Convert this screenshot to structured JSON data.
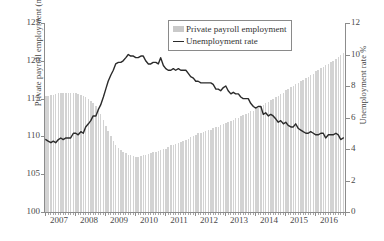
{
  "chart_data": {
    "type": "line",
    "title": "",
    "xlabel": "",
    "ylabel": "Private payroll employment (millions)",
    "ylabel_right": "Unemployment rate %",
    "ylim": [
      100,
      125
    ],
    "ylim_right": [
      0,
      12
    ],
    "xlim": [
      2007,
      2017
    ],
    "grid": false,
    "legend_position": "top-center",
    "yticks": [
      "125",
      "120",
      "115",
      "110",
      "105",
      "100"
    ],
    "yticks_right": [
      "12",
      "10",
      "8",
      "6",
      "4",
      "2",
      "0"
    ],
    "xticks": [
      "2007",
      "2008",
      "2009",
      "2010",
      "2011",
      "2012",
      "2013",
      "2014",
      "2015",
      "2016"
    ],
    "legend": [
      {
        "label": "Private payroll employment",
        "type": "bar",
        "color": "#d3d3d3"
      },
      {
        "label": "Unemployment rate",
        "type": "line",
        "color": "#2b2b2b"
      }
    ],
    "series": [
      {
        "name": "Private payroll employment",
        "type": "bar",
        "axis": "left",
        "unit": "millions",
        "x": [
          2007.0,
          2007.08,
          2007.17,
          2007.25,
          2007.33,
          2007.42,
          2007.5,
          2007.58,
          2007.67,
          2007.75,
          2007.83,
          2007.92,
          2008.0,
          2008.08,
          2008.17,
          2008.25,
          2008.33,
          2008.42,
          2008.5,
          2008.58,
          2008.67,
          2008.75,
          2008.83,
          2008.92,
          2009.0,
          2009.08,
          2009.17,
          2009.25,
          2009.33,
          2009.42,
          2009.5,
          2009.58,
          2009.67,
          2009.75,
          2009.83,
          2009.92,
          2010.0,
          2010.08,
          2010.17,
          2010.25,
          2010.33,
          2010.42,
          2010.5,
          2010.58,
          2010.67,
          2010.75,
          2010.83,
          2010.92,
          2011.0,
          2011.08,
          2011.17,
          2011.25,
          2011.33,
          2011.42,
          2011.5,
          2011.58,
          2011.67,
          2011.75,
          2011.83,
          2011.92,
          2012.0,
          2012.08,
          2012.17,
          2012.25,
          2012.33,
          2012.42,
          2012.5,
          2012.58,
          2012.67,
          2012.75,
          2012.83,
          2012.92,
          2013.0,
          2013.08,
          2013.17,
          2013.25,
          2013.33,
          2013.42,
          2013.5,
          2013.58,
          2013.67,
          2013.75,
          2013.83,
          2013.92,
          2014.0,
          2014.08,
          2014.17,
          2014.25,
          2014.33,
          2014.42,
          2014.5,
          2014.58,
          2014.67,
          2014.75,
          2014.83,
          2014.92,
          2015.0,
          2015.08,
          2015.17,
          2015.25,
          2015.33,
          2015.42,
          2015.5,
          2015.58,
          2015.67,
          2015.75,
          2015.83,
          2015.92,
          2016.0,
          2016.08,
          2016.17,
          2016.25,
          2016.33,
          2016.42,
          2016.5,
          2016.58,
          2016.67,
          2016.75,
          2016.83,
          2016.92
        ],
        "values": [
          115.3,
          115.4,
          115.5,
          115.5,
          115.6,
          115.7,
          115.7,
          115.7,
          115.8,
          115.8,
          115.8,
          115.8,
          115.7,
          115.6,
          115.5,
          115.3,
          115.2,
          115.0,
          114.7,
          114.4,
          114.0,
          113.5,
          112.9,
          112.2,
          111.4,
          110.7,
          110.0,
          109.4,
          108.9,
          108.5,
          108.2,
          108.0,
          107.8,
          107.6,
          107.5,
          107.4,
          107.3,
          107.3,
          107.4,
          107.5,
          107.6,
          107.7,
          107.8,
          107.9,
          108.0,
          108.1,
          108.2,
          108.3,
          108.4,
          108.6,
          108.8,
          108.9,
          109.0,
          109.1,
          109.2,
          109.4,
          109.5,
          109.7,
          109.9,
          110.0,
          110.2,
          110.4,
          110.5,
          110.6,
          110.7,
          110.8,
          110.9,
          111.1,
          111.2,
          111.3,
          111.5,
          111.6,
          111.8,
          111.9,
          112.1,
          112.2,
          112.4,
          112.5,
          112.7,
          112.8,
          113.0,
          113.1,
          113.3,
          113.4,
          113.6,
          113.8,
          114.0,
          114.2,
          114.4,
          114.6,
          114.8,
          115.0,
          115.2,
          115.4,
          115.6,
          115.8,
          116.1,
          116.3,
          116.5,
          116.7,
          116.9,
          117.1,
          117.3,
          117.5,
          117.7,
          117.9,
          118.1,
          118.3,
          118.6,
          118.8,
          119.0,
          119.2,
          119.4,
          119.6,
          119.8,
          120.0,
          120.3,
          120.5,
          120.8,
          121.0
        ]
      },
      {
        "name": "Unemployment rate",
        "type": "line",
        "axis": "right",
        "unit": "%",
        "x": [
          2007.0,
          2007.08,
          2007.17,
          2007.25,
          2007.33,
          2007.42,
          2007.5,
          2007.58,
          2007.67,
          2007.75,
          2007.83,
          2007.92,
          2008.0,
          2008.08,
          2008.17,
          2008.25,
          2008.33,
          2008.42,
          2008.5,
          2008.58,
          2008.67,
          2008.75,
          2008.83,
          2008.92,
          2009.0,
          2009.08,
          2009.17,
          2009.25,
          2009.33,
          2009.42,
          2009.5,
          2009.58,
          2009.67,
          2009.75,
          2009.83,
          2009.92,
          2010.0,
          2010.08,
          2010.17,
          2010.25,
          2010.33,
          2010.42,
          2010.5,
          2010.58,
          2010.67,
          2010.75,
          2010.83,
          2010.92,
          2011.0,
          2011.08,
          2011.17,
          2011.25,
          2011.33,
          2011.42,
          2011.5,
          2011.58,
          2011.67,
          2011.75,
          2011.83,
          2011.92,
          2012.0,
          2012.08,
          2012.17,
          2012.25,
          2012.33,
          2012.42,
          2012.5,
          2012.58,
          2012.67,
          2012.75,
          2012.83,
          2012.92,
          2013.0,
          2013.08,
          2013.17,
          2013.25,
          2013.33,
          2013.42,
          2013.5,
          2013.58,
          2013.67,
          2013.75,
          2013.83,
          2013.92,
          2014.0,
          2014.08,
          2014.17,
          2014.25,
          2014.33,
          2014.42,
          2014.5,
          2014.58,
          2014.67,
          2014.75,
          2014.83,
          2014.92,
          2015.0,
          2015.08,
          2015.17,
          2015.25,
          2015.33,
          2015.42,
          2015.5,
          2015.58,
          2015.67,
          2015.75,
          2015.83,
          2015.92,
          2016.0,
          2016.08,
          2016.17,
          2016.25,
          2016.33,
          2016.42,
          2016.5,
          2016.58,
          2016.67,
          2016.75,
          2016.83,
          2016.92
        ],
        "values": [
          4.6,
          4.5,
          4.4,
          4.5,
          4.4,
          4.6,
          4.7,
          4.6,
          4.7,
          4.7,
          4.7,
          5.0,
          5.0,
          4.9,
          5.1,
          5.0,
          5.4,
          5.6,
          5.8,
          6.1,
          6.1,
          6.5,
          6.8,
          7.3,
          7.8,
          8.3,
          8.7,
          9.0,
          9.4,
          9.5,
          9.5,
          9.6,
          9.8,
          10.0,
          9.9,
          9.9,
          9.8,
          9.8,
          9.9,
          9.9,
          9.6,
          9.4,
          9.4,
          9.5,
          9.5,
          9.4,
          9.8,
          9.3,
          9.1,
          9.0,
          9.0,
          9.1,
          9.0,
          9.1,
          9.0,
          9.0,
          9.0,
          8.8,
          8.6,
          8.5,
          8.3,
          8.3,
          8.2,
          8.2,
          8.2,
          8.2,
          8.2,
          8.1,
          7.8,
          7.8,
          7.7,
          7.9,
          8.0,
          7.7,
          7.5,
          7.6,
          7.5,
          7.5,
          7.3,
          7.2,
          7.2,
          7.2,
          6.9,
          6.7,
          6.6,
          6.7,
          6.7,
          6.2,
          6.3,
          6.1,
          6.2,
          6.1,
          5.9,
          5.7,
          5.8,
          5.6,
          5.7,
          5.5,
          5.4,
          5.4,
          5.6,
          5.3,
          5.2,
          5.1,
          5.0,
          5.0,
          5.1,
          5.0,
          4.9,
          4.9,
          5.0,
          5.0,
          4.7,
          4.9,
          4.9,
          4.9,
          5.0,
          4.9,
          4.6,
          4.7
        ]
      }
    ]
  }
}
